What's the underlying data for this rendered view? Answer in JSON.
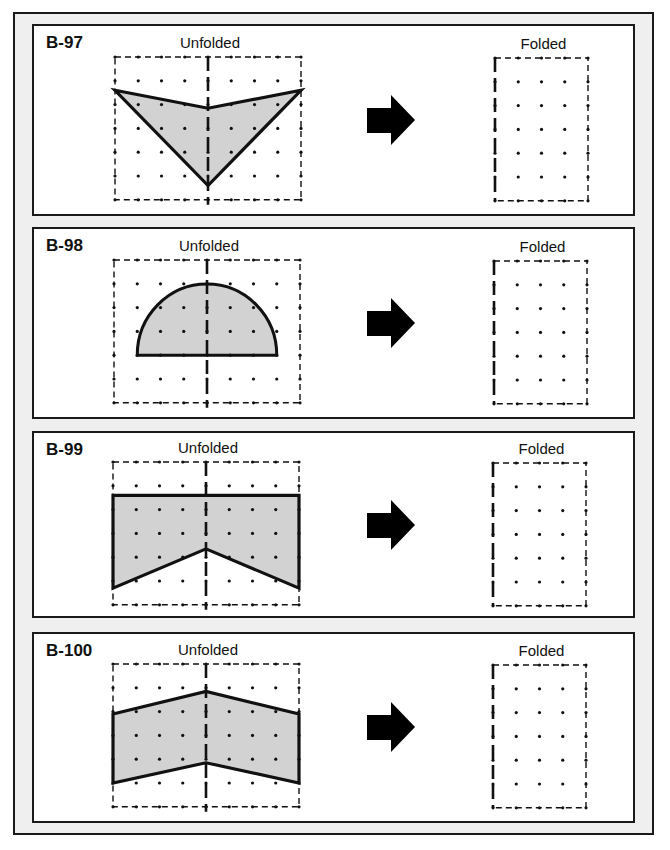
{
  "colors": {
    "fill": "#d2d2d2",
    "stroke": "#111111",
    "frame_bg": "#efefef"
  },
  "panels": [
    {
      "id": "B-97",
      "unfolded_label": "Unfolded",
      "folded_label": "Folded",
      "shape": {
        "type": "polygon",
        "points_grid": [
          [
            0,
            1.4
          ],
          [
            4,
            2.15
          ],
          [
            8,
            1.4
          ],
          [
            4,
            5.4
          ]
        ]
      }
    },
    {
      "id": "B-98",
      "unfolded_label": "Unfolded",
      "folded_label": "Folded",
      "shape": {
        "type": "semicircle",
        "center_grid": [
          4,
          4
        ],
        "radius_cols": 3
      }
    },
    {
      "id": "B-99",
      "unfolded_label": "Unfolded",
      "folded_label": "Folded",
      "shape": {
        "type": "polygon",
        "points_grid": [
          [
            0,
            1.4
          ],
          [
            8,
            1.4
          ],
          [
            8,
            5.3
          ],
          [
            4,
            3.65
          ],
          [
            0,
            5.3
          ]
        ]
      }
    },
    {
      "id": "B-100",
      "unfolded_label": "Unfolded",
      "folded_label": "Folded",
      "shape": {
        "type": "polygon",
        "points_grid": [
          [
            0,
            2.1
          ],
          [
            4,
            1.15
          ],
          [
            8,
            2.1
          ],
          [
            8,
            5.0
          ],
          [
            4,
            4.15
          ],
          [
            0,
            5.0
          ]
        ]
      }
    }
  ],
  "arrow_icon": "right-arrow"
}
